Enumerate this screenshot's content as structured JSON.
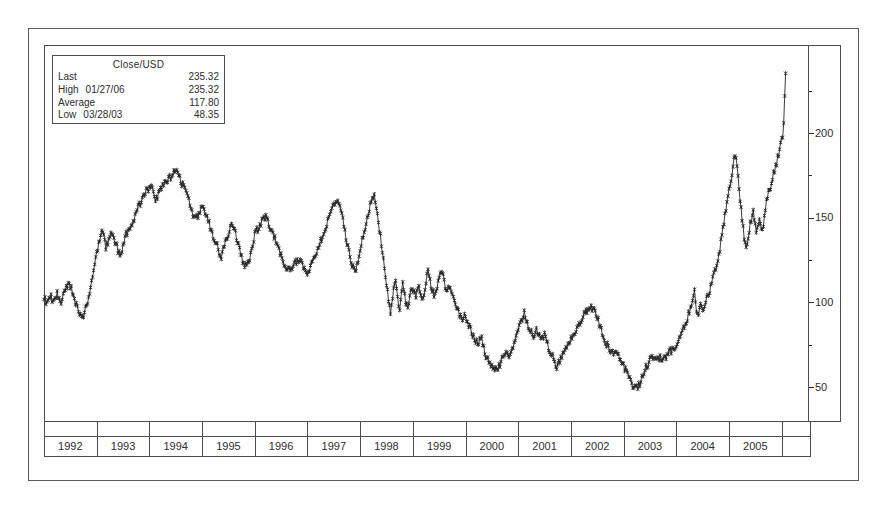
{
  "figure": {
    "background": "#fefefe",
    "ink": "#2e2e2e",
    "line_color": "#262626",
    "frame_color": "#4d4d4d",
    "outer_border_color": "#5a5a5a"
  },
  "legend": {
    "title": "Close/USD",
    "rows": [
      {
        "label": "Last",
        "date": "",
        "value": "235.32"
      },
      {
        "label": "High",
        "date": "01/27/06",
        "value": "235.32"
      },
      {
        "label": "Average",
        "date": "",
        "value": "117.80"
      },
      {
        "label": "Low",
        "date": "03/28/03",
        "value": "48.35"
      }
    ]
  },
  "chart_data": {
    "type": "line",
    "title": "Close/USD",
    "marker": "asterisk",
    "grid": false,
    "legend_position": "top-left",
    "x_axis": {
      "categories": [
        "1992",
        "1993",
        "1994",
        "1995",
        "1996",
        "1997",
        "1998",
        "1999",
        "2000",
        "2001",
        "2002",
        "2003",
        "2004",
        "2005"
      ],
      "range": [
        1992.0,
        2006.5
      ]
    },
    "y_axis": {
      "side": "right",
      "ticks": [
        50,
        100,
        150,
        200
      ],
      "minor_ticks": [
        75,
        125,
        175,
        225
      ],
      "range": [
        30,
        252
      ]
    },
    "stats": {
      "last": 235.32,
      "high": 235.32,
      "high_date": "01/27/06",
      "average": 117.8,
      "low": 48.35,
      "low_date": "03/28/03"
    },
    "series": [
      {
        "name": "Close/USD",
        "points_per_year": 52,
        "jitter_amplitude": 2.1,
        "anchor_points": [
          [
            1992.0,
            103
          ],
          [
            1992.06,
            99
          ],
          [
            1992.12,
            104
          ],
          [
            1992.18,
            100
          ],
          [
            1992.25,
            105
          ],
          [
            1992.32,
            99
          ],
          [
            1992.4,
            107
          ],
          [
            1992.48,
            112
          ],
          [
            1992.55,
            105
          ],
          [
            1992.62,
            98
          ],
          [
            1992.68,
            94
          ],
          [
            1992.74,
            91
          ],
          [
            1992.8,
            97
          ],
          [
            1992.86,
            105
          ],
          [
            1992.92,
            114
          ],
          [
            1993.0,
            130
          ],
          [
            1993.06,
            136
          ],
          [
            1993.1,
            143
          ],
          [
            1993.17,
            133
          ],
          [
            1993.28,
            140
          ],
          [
            1993.37,
            134
          ],
          [
            1993.45,
            126
          ],
          [
            1993.55,
            140
          ],
          [
            1993.65,
            145
          ],
          [
            1993.72,
            150
          ],
          [
            1993.8,
            157
          ],
          [
            1993.9,
            164
          ],
          [
            1993.97,
            167
          ],
          [
            1994.05,
            171
          ],
          [
            1994.12,
            160
          ],
          [
            1994.2,
            166
          ],
          [
            1994.3,
            170
          ],
          [
            1994.4,
            174
          ],
          [
            1994.5,
            178
          ],
          [
            1994.57,
            174
          ],
          [
            1994.65,
            168
          ],
          [
            1994.75,
            160
          ],
          [
            1994.82,
            152
          ],
          [
            1994.9,
            150
          ],
          [
            1995.0,
            157
          ],
          [
            1995.08,
            152
          ],
          [
            1995.18,
            142
          ],
          [
            1995.28,
            134
          ],
          [
            1995.36,
            126
          ],
          [
            1995.45,
            136
          ],
          [
            1995.55,
            146
          ],
          [
            1995.62,
            143
          ],
          [
            1995.7,
            132
          ],
          [
            1995.8,
            122
          ],
          [
            1995.9,
            124
          ],
          [
            1996.0,
            140
          ],
          [
            1996.1,
            146
          ],
          [
            1996.2,
            151
          ],
          [
            1996.3,
            144
          ],
          [
            1996.4,
            136
          ],
          [
            1996.5,
            128
          ],
          [
            1996.6,
            118
          ],
          [
            1996.7,
            121
          ],
          [
            1996.8,
            125
          ],
          [
            1996.88,
            123
          ],
          [
            1996.95,
            119
          ],
          [
            1997.02,
            118
          ],
          [
            1997.1,
            124
          ],
          [
            1997.2,
            132
          ],
          [
            1997.3,
            140
          ],
          [
            1997.4,
            150
          ],
          [
            1997.5,
            158
          ],
          [
            1997.57,
            161
          ],
          [
            1997.65,
            152
          ],
          [
            1997.75,
            135
          ],
          [
            1997.83,
            124
          ],
          [
            1997.9,
            118
          ],
          [
            1997.97,
            126
          ],
          [
            1998.05,
            138
          ],
          [
            1998.12,
            148
          ],
          [
            1998.2,
            158
          ],
          [
            1998.27,
            163
          ],
          [
            1998.33,
            152
          ],
          [
            1998.4,
            135
          ],
          [
            1998.47,
            118
          ],
          [
            1998.53,
            103
          ],
          [
            1998.58,
            93
          ],
          [
            1998.63,
            108
          ],
          [
            1998.68,
            114
          ],
          [
            1998.74,
            93
          ],
          [
            1998.8,
            112
          ],
          [
            1998.85,
            103
          ],
          [
            1998.9,
            95
          ],
          [
            1998.96,
            108
          ],
          [
            1999.05,
            104
          ],
          [
            1999.12,
            110
          ],
          [
            1999.2,
            100
          ],
          [
            1999.28,
            120
          ],
          [
            1999.35,
            108
          ],
          [
            1999.43,
            103
          ],
          [
            1999.5,
            114
          ],
          [
            1999.56,
            118
          ],
          [
            1999.63,
            106
          ],
          [
            1999.7,
            110
          ],
          [
            1999.78,
            103
          ],
          [
            1999.85,
            95
          ],
          [
            1999.93,
            90
          ],
          [
            2000.0,
            92
          ],
          [
            2000.08,
            85
          ],
          [
            2000.15,
            80
          ],
          [
            2000.23,
            76
          ],
          [
            2000.3,
            80
          ],
          [
            2000.38,
            68
          ],
          [
            2000.45,
            65
          ],
          [
            2000.53,
            62
          ],
          [
            2000.6,
            60
          ],
          [
            2000.68,
            65
          ],
          [
            2000.75,
            70
          ],
          [
            2000.83,
            68
          ],
          [
            2000.9,
            74
          ],
          [
            2000.97,
            80
          ],
          [
            2001.05,
            88
          ],
          [
            2001.12,
            94
          ],
          [
            2001.2,
            85
          ],
          [
            2001.28,
            80
          ],
          [
            2001.35,
            84
          ],
          [
            2001.42,
            79
          ],
          [
            2001.5,
            81
          ],
          [
            2001.57,
            74
          ],
          [
            2001.65,
            68
          ],
          [
            2001.72,
            60
          ],
          [
            2001.8,
            66
          ],
          [
            2001.88,
            72
          ],
          [
            2001.95,
            76
          ],
          [
            2002.02,
            80
          ],
          [
            2002.1,
            84
          ],
          [
            2002.18,
            88
          ],
          [
            2002.25,
            93
          ],
          [
            2002.33,
            96
          ],
          [
            2002.4,
            97
          ],
          [
            2002.48,
            93
          ],
          [
            2002.55,
            86
          ],
          [
            2002.63,
            78
          ],
          [
            2002.7,
            74
          ],
          [
            2002.78,
            70
          ],
          [
            2002.85,
            72
          ],
          [
            2002.92,
            68
          ],
          [
            2003.0,
            63
          ],
          [
            2003.08,
            57
          ],
          [
            2003.16,
            51
          ],
          [
            2003.24,
            48.4
          ],
          [
            2003.32,
            53
          ],
          [
            2003.4,
            60
          ],
          [
            2003.48,
            65
          ],
          [
            2003.56,
            67
          ],
          [
            2003.64,
            69
          ],
          [
            2003.72,
            66
          ],
          [
            2003.8,
            68
          ],
          [
            2003.88,
            71
          ],
          [
            2003.96,
            73
          ],
          [
            2004.04,
            77
          ],
          [
            2004.12,
            83
          ],
          [
            2004.2,
            90
          ],
          [
            2004.28,
            97
          ],
          [
            2004.34,
            108
          ],
          [
            2004.4,
            92
          ],
          [
            2004.46,
            99
          ],
          [
            2004.52,
            96
          ],
          [
            2004.6,
            104
          ],
          [
            2004.68,
            112
          ],
          [
            2004.75,
            120
          ],
          [
            2004.82,
            130
          ],
          [
            2004.88,
            142
          ],
          [
            2004.94,
            155
          ],
          [
            2005.0,
            166
          ],
          [
            2005.06,
            177
          ],
          [
            2005.12,
            189
          ],
          [
            2005.17,
            176
          ],
          [
            2005.22,
            158
          ],
          [
            2005.28,
            140
          ],
          [
            2005.33,
            132
          ],
          [
            2005.4,
            146
          ],
          [
            2005.46,
            154
          ],
          [
            2005.52,
            143
          ],
          [
            2005.58,
            150
          ],
          [
            2005.64,
            142
          ],
          [
            2005.7,
            158
          ],
          [
            2005.76,
            166
          ],
          [
            2005.82,
            172
          ],
          [
            2005.88,
            180
          ],
          [
            2005.93,
            186
          ],
          [
            2005.98,
            193
          ],
          [
            2006.03,
            199
          ],
          [
            2006.075,
            235.32
          ]
        ]
      }
    ]
  }
}
